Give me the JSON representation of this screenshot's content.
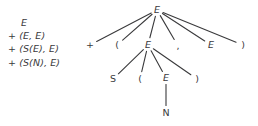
{
  "figure": {
    "background_color": "#ffffff",
    "ink_color": "#3a3a3c"
  },
  "derivation": {
    "name": "derivation-sequence",
    "lines": [
      "E",
      "+ (E, E)",
      "+ (S(E), E)",
      "+ (S(N), E)"
    ]
  },
  "tree": {
    "name": "parse-tree",
    "nodes": [
      {
        "id": "root-E",
        "label": "E",
        "kind": "nonterminal",
        "x": 157,
        "y": 10
      },
      {
        "id": "lvl1-plus",
        "label": "+",
        "kind": "terminal",
        "x": 90,
        "y": 45
      },
      {
        "id": "lvl1-lpar",
        "label": "(",
        "kind": "terminal",
        "x": 117,
        "y": 45
      },
      {
        "id": "lvl1-E",
        "label": "E",
        "kind": "nonterminal",
        "x": 148,
        "y": 45
      },
      {
        "id": "lvl1-comma",
        "label": ",",
        "kind": "terminal",
        "x": 178,
        "y": 46
      },
      {
        "id": "lvl1-E2",
        "label": "E",
        "kind": "nonterminal",
        "x": 211,
        "y": 45
      },
      {
        "id": "lvl1-rpar",
        "label": ")",
        "kind": "terminal",
        "x": 243,
        "y": 45
      },
      {
        "id": "lvl2-S",
        "label": "S",
        "kind": "terminal",
        "x": 113,
        "y": 79
      },
      {
        "id": "lvl2-lpar",
        "label": "(",
        "kind": "terminal",
        "x": 140,
        "y": 79
      },
      {
        "id": "lvl2-E",
        "label": "E",
        "kind": "nonterminal",
        "x": 166,
        "y": 78
      },
      {
        "id": "lvl2-rpar",
        "label": ")",
        "kind": "terminal",
        "x": 197,
        "y": 79
      },
      {
        "id": "lvl3-N",
        "label": "N",
        "kind": "terminal",
        "x": 166,
        "y": 113
      }
    ],
    "edges": [
      {
        "from": "root-E",
        "to": "lvl1-plus"
      },
      {
        "from": "root-E",
        "to": "lvl1-lpar"
      },
      {
        "from": "root-E",
        "to": "lvl1-E"
      },
      {
        "from": "root-E",
        "to": "lvl1-comma"
      },
      {
        "from": "root-E",
        "to": "lvl1-E2"
      },
      {
        "from": "root-E",
        "to": "lvl1-rpar"
      },
      {
        "from": "lvl1-E",
        "to": "lvl2-S"
      },
      {
        "from": "lvl1-E",
        "to": "lvl2-lpar"
      },
      {
        "from": "lvl1-E",
        "to": "lvl2-E"
      },
      {
        "from": "lvl1-E",
        "to": "lvl2-rpar"
      },
      {
        "from": "lvl2-E",
        "to": "lvl3-N"
      }
    ]
  }
}
